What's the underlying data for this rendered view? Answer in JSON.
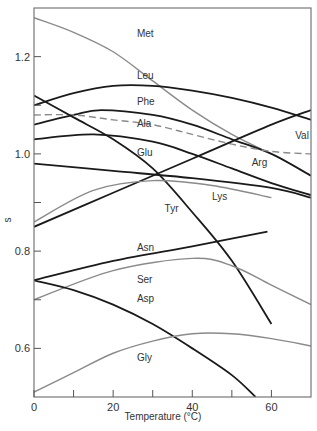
{
  "chart_data": {
    "type": "line",
    "title": "",
    "xlabel": "Temperature (°C)",
    "ylabel": "s",
    "xlim": [
      0,
      70
    ],
    "ylim": [
      0.5,
      1.3
    ],
    "x_ticks": [
      0,
      10,
      20,
      30,
      40,
      50,
      60
    ],
    "x_tick_labels": [
      "0",
      "20",
      "40",
      "60"
    ],
    "y_ticks": [
      0.6,
      0.7,
      0.8,
      0.9,
      1.0,
      1.1,
      1.2
    ],
    "y_tick_labels": [
      "0.6",
      "0.8",
      "1.0",
      "1.2"
    ],
    "grid": false,
    "legend": "inline labels",
    "series": [
      {
        "name": "Met",
        "color": "#8a8a8a",
        "style": "solid",
        "label_pos": [
          26,
          1.24
        ],
        "x": [
          0,
          10,
          20,
          30,
          40,
          50,
          60
        ],
        "y": [
          1.28,
          1.25,
          1.21,
          1.15,
          1.09,
          1.04,
          1.0
        ]
      },
      {
        "name": "Leu",
        "color": "#1a1a1a",
        "style": "solid",
        "label_pos": [
          26,
          1.155
        ],
        "x": [
          0,
          10,
          20,
          30,
          40,
          50,
          60,
          70
        ],
        "y": [
          1.1,
          1.125,
          1.14,
          1.14,
          1.13,
          1.115,
          1.095,
          1.07
        ]
      },
      {
        "name": "Phe",
        "color": "#1a1a1a",
        "style": "solid",
        "label_pos": [
          26,
          1.1
        ],
        "x": [
          0,
          10,
          17,
          30,
          40,
          50,
          60,
          70
        ],
        "y": [
          1.06,
          1.08,
          1.09,
          1.08,
          1.06,
          1.03,
          1.0,
          0.955
        ]
      },
      {
        "name": "Ala",
        "color": "#8a8a8a",
        "style": "dashed",
        "label_pos": [
          26,
          1.055
        ],
        "x": [
          0,
          10,
          20,
          30,
          40,
          50,
          60,
          70
        ],
        "y": [
          1.08,
          1.08,
          1.07,
          1.06,
          1.04,
          1.02,
          1.005,
          1.0
        ]
      },
      {
        "name": "Arg",
        "color": "#1a1a1a",
        "style": "solid",
        "label_pos": [
          55,
          0.975
        ],
        "x": [
          0,
          15,
          30,
          40,
          50,
          60,
          70
        ],
        "y": [
          1.03,
          1.04,
          1.025,
          1.0,
          0.97,
          0.94,
          0.915
        ]
      },
      {
        "name": "Tyr",
        "color": "#1a1a1a",
        "style": "solid",
        "label_pos": [
          33,
          0.88
        ],
        "x": [
          0,
          10,
          20,
          30,
          40,
          50,
          60
        ],
        "y": [
          1.12,
          1.075,
          1.03,
          0.97,
          0.88,
          0.78,
          0.65
        ]
      },
      {
        "name": "Glu",
        "color": "#1a1a1a",
        "style": "solid",
        "label_pos": [
          26,
          0.995
        ],
        "x": [
          0,
          20,
          40,
          60,
          70
        ],
        "y": [
          0.98,
          0.965,
          0.95,
          0.93,
          0.91
        ]
      },
      {
        "name": "Val",
        "color": "#1a1a1a",
        "style": "solid",
        "label_pos": [
          66,
          1.03
        ],
        "x": [
          0,
          20,
          40,
          60,
          70
        ],
        "y": [
          0.85,
          0.92,
          0.99,
          1.06,
          1.09
        ]
      },
      {
        "name": "Lys",
        "color": "#8a8a8a",
        "style": "solid",
        "label_pos": [
          45,
          0.905
        ],
        "x": [
          0,
          15,
          30,
          45,
          60
        ],
        "y": [
          0.86,
          0.925,
          0.945,
          0.935,
          0.91
        ]
      },
      {
        "name": "Asn",
        "color": "#1a1a1a",
        "style": "solid",
        "label_pos": [
          26,
          0.8
        ],
        "x": [
          0,
          20,
          40,
          59
        ],
        "y": [
          0.74,
          0.78,
          0.81,
          0.84
        ]
      },
      {
        "name": "Ser",
        "color": "#8a8a8a",
        "style": "solid",
        "label_pos": [
          26,
          0.735
        ],
        "x": [
          0,
          20,
          40,
          50,
          60,
          70
        ],
        "y": [
          0.7,
          0.76,
          0.785,
          0.77,
          0.73,
          0.69
        ]
      },
      {
        "name": "Asp",
        "color": "#1a1a1a",
        "style": "solid",
        "label_pos": [
          26,
          0.695
        ],
        "x": [
          0,
          10,
          20,
          30,
          40,
          50,
          56
        ],
        "y": [
          0.74,
          0.72,
          0.69,
          0.65,
          0.6,
          0.545,
          0.5
        ]
      },
      {
        "name": "Gly",
        "color": "#8a8a8a",
        "style": "solid",
        "label_pos": [
          26,
          0.575
        ],
        "x": [
          0,
          10,
          20,
          30,
          40,
          50,
          60,
          70
        ],
        "y": [
          0.51,
          0.55,
          0.59,
          0.615,
          0.63,
          0.63,
          0.62,
          0.605
        ]
      }
    ]
  }
}
